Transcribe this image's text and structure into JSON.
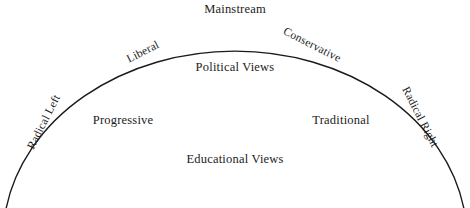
{
  "figure": {
    "background_color": "#ffffff",
    "stroke_color": "#1a1a1a",
    "text_color": "#1c1c1c",
    "width": 470,
    "height": 208
  },
  "chart_data": {
    "type": "diagram",
    "shape": "elliptical-arc-dome",
    "title": "",
    "grid": false,
    "legend": false,
    "axis_labels": {
      "inner_upper": "Political Views",
      "inner_lower": "Educational Views"
    },
    "arc_labels": [
      {
        "label": "Radical Left",
        "position": "left-end",
        "angle_deg": -63,
        "x": 44,
        "y": 122
      },
      {
        "label": "Liberal",
        "position": "left-upper",
        "angle_deg": -27,
        "x": 143,
        "y": 52
      },
      {
        "label": "Mainstream",
        "position": "apex",
        "angle_deg": 0,
        "x": 235,
        "y": 9
      },
      {
        "label": "Conservative",
        "position": "right-upper",
        "angle_deg": 27,
        "x": 312,
        "y": 45
      },
      {
        "label": "Radical Right",
        "position": "right-end",
        "angle_deg": 63,
        "x": 420,
        "y": 117
      }
    ],
    "inner_labels": [
      {
        "label": "Political Views",
        "x": 235,
        "y": 67
      },
      {
        "label": "Progressive",
        "x": 123,
        "y": 120
      },
      {
        "label": "Traditional",
        "x": 341,
        "y": 120
      },
      {
        "label": "Educational Views",
        "x": 235,
        "y": 159
      }
    ]
  },
  "labels": {
    "mainstream": "Mainstream",
    "liberal": "Liberal",
    "conservative": "Conservative",
    "radical_left": "Radical Left",
    "radical_right": "Radical Right",
    "political_views": "Political Views",
    "educational_views": "Educational Views",
    "progressive": "Progressive",
    "traditional": "Traditional"
  }
}
